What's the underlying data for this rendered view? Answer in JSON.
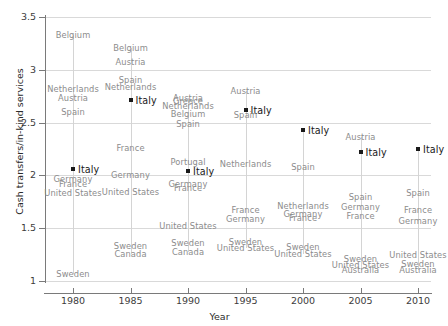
{
  "chart_data": {
    "type": "scatter",
    "title": "",
    "xlabel": "Year",
    "ylabel": "Cash transfers/in-kind services",
    "xlim": [
      1977.5,
      2012.5
    ],
    "ylim": [
      0.87,
      3.6
    ],
    "xticks": [
      1980,
      1985,
      1990,
      1995,
      2000,
      2005,
      2010
    ],
    "yticks": [
      1,
      1.5,
      2,
      2.5,
      3,
      3.5
    ],
    "grid": true,
    "legend": "none",
    "highlight_series": "Italy",
    "columns": [
      {
        "year": 1980,
        "points": [
          {
            "label": "Belgium",
            "value": 3.33
          },
          {
            "label": "Netherlands",
            "value": 2.82
          },
          {
            "label": "Austria",
            "value": 2.73
          },
          {
            "label": "Spain",
            "value": 2.6
          },
          {
            "label": "Italy",
            "value": 2.06,
            "highlight": true
          },
          {
            "label": "Germany",
            "value": 1.97
          },
          {
            "label": "France",
            "value": 1.92
          },
          {
            "label": "United States",
            "value": 1.83
          },
          {
            "label": "Sweden",
            "value": 1.07
          }
        ]
      },
      {
        "year": 1985,
        "points": [
          {
            "label": "Belgium",
            "value": 3.21
          },
          {
            "label": "Austria",
            "value": 3.07
          },
          {
            "label": "Spain",
            "value": 2.9
          },
          {
            "label": "Netherlands",
            "value": 2.84
          },
          {
            "label": "Italy",
            "value": 2.71,
            "highlight": true
          },
          {
            "label": "France",
            "value": 2.26
          },
          {
            "label": "Germany",
            "value": 2.0
          },
          {
            "label": "United States",
            "value": 1.84
          },
          {
            "label": "Sweden",
            "value": 1.33
          },
          {
            "label": "Canada",
            "value": 1.26
          }
        ]
      },
      {
        "year": 1990,
        "points": [
          {
            "label": "Austria",
            "value": 2.73
          },
          {
            "label": "Greece",
            "value": 2.7
          },
          {
            "label": "Netherlands",
            "value": 2.66
          },
          {
            "label": "Belgium",
            "value": 2.58
          },
          {
            "label": "Spain",
            "value": 2.49
          },
          {
            "label": "Portugal",
            "value": 2.13
          },
          {
            "label": "Italy",
            "value": 2.04,
            "highlight": true
          },
          {
            "label": "Germany",
            "value": 1.92
          },
          {
            "label": "France",
            "value": 1.88
          },
          {
            "label": "United States",
            "value": 1.52
          },
          {
            "label": "Sweden",
            "value": 1.36
          },
          {
            "label": "Canada",
            "value": 1.27
          }
        ]
      },
      {
        "year": 1995,
        "points": [
          {
            "label": "Austria",
            "value": 2.8
          },
          {
            "label": "Italy",
            "value": 2.62,
            "highlight": true
          },
          {
            "label": "Spain",
            "value": 2.57
          },
          {
            "label": "Netherlands",
            "value": 2.11
          },
          {
            "label": "France",
            "value": 1.67
          },
          {
            "label": "Germany",
            "value": 1.59
          },
          {
            "label": "Sweden",
            "value": 1.37
          },
          {
            "label": "United States",
            "value": 1.31
          }
        ]
      },
      {
        "year": 2000,
        "points": [
          {
            "label": "Italy",
            "value": 2.43,
            "highlight": true
          },
          {
            "label": "Spain",
            "value": 2.08
          },
          {
            "label": "Netherlands",
            "value": 1.71
          },
          {
            "label": "Germany",
            "value": 1.63
          },
          {
            "label": "France",
            "value": 1.6
          },
          {
            "label": "Sweden",
            "value": 1.32
          },
          {
            "label": "United States",
            "value": 1.26
          }
        ]
      },
      {
        "year": 2005,
        "points": [
          {
            "label": "Austria",
            "value": 2.36
          },
          {
            "label": "Italy",
            "value": 2.22,
            "highlight": true
          },
          {
            "label": "Spain",
            "value": 1.8
          },
          {
            "label": "Germany",
            "value": 1.7
          },
          {
            "label": "France",
            "value": 1.62
          },
          {
            "label": "Sweden",
            "value": 1.21
          },
          {
            "label": "United States",
            "value": 1.15
          },
          {
            "label": "Australia",
            "value": 1.1
          }
        ]
      },
      {
        "year": 2010,
        "points": [
          {
            "label": "Italy",
            "value": 2.25,
            "highlight": true
          },
          {
            "label": "Spain",
            "value": 1.83
          },
          {
            "label": "France",
            "value": 1.67
          },
          {
            "label": "Germany",
            "value": 1.57
          },
          {
            "label": "United States",
            "value": 1.25
          },
          {
            "label": "Sweden",
            "value": 1.16
          },
          {
            "label": "Australia",
            "value": 1.1
          }
        ]
      }
    ]
  }
}
